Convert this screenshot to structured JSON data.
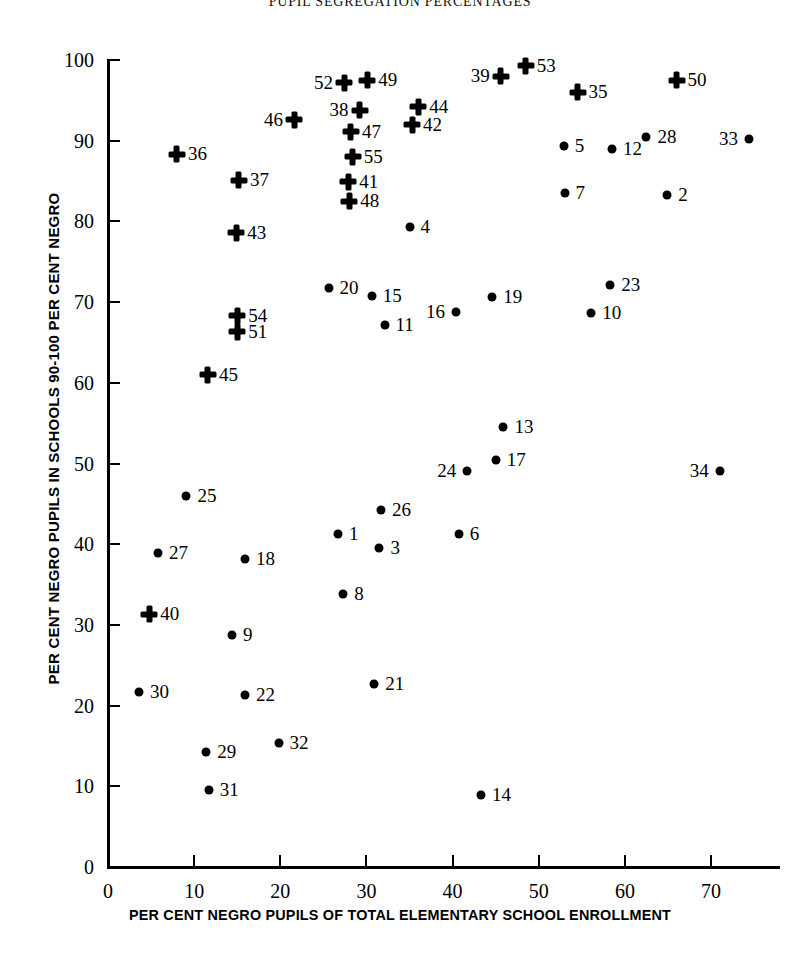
{
  "title": "PUPIL SEGREGATION PERCENTAGES",
  "axes": {
    "x_title": "PER CENT NEGRO PUPILS OF TOTAL ELEMENTARY SCHOOL ENROLLMENT",
    "y_title": "PER CENT NEGRO PUPILS IN SCHOOLS 90-100 PER CENT NEGRO",
    "x_ticks": [
      "0",
      "10",
      "20",
      "30",
      "40",
      "50",
      "60",
      "70"
    ],
    "y_ticks": [
      "0",
      "10",
      "20",
      "30",
      "40",
      "50",
      "60",
      "70",
      "80",
      "90",
      "100"
    ]
  },
  "chart_data": {
    "type": "scatter",
    "title": "PUPIL SEGREGATION PERCENTAGES",
    "xlabel": "PER CENT NEGRO PUPILS OF TOTAL ELEMENTARY SCHOOL ENROLLMENT",
    "ylabel": "PER CENT NEGRO PUPILS IN SCHOOLS 90-100 PER CENT NEGRO",
    "xlim": [
      0,
      78
    ],
    "ylim": [
      0,
      100
    ],
    "xticks": [
      0,
      10,
      20,
      30,
      40,
      50,
      60,
      70
    ],
    "yticks": [
      0,
      10,
      20,
      30,
      40,
      50,
      60,
      70,
      80,
      90,
      100
    ],
    "grid": false,
    "legend": "none",
    "series": [
      {
        "name": "circle-marker-cities",
        "marker": "circle",
        "points": [
          {
            "label": "1",
            "x": 26.7,
            "y": 41.3,
            "label_side": "right"
          },
          {
            "label": "2",
            "x": 64.9,
            "y": 83.3,
            "label_side": "right"
          },
          {
            "label": "3",
            "x": 31.5,
            "y": 39.5,
            "label_side": "right"
          },
          {
            "label": "4",
            "x": 35.0,
            "y": 79.3,
            "label_side": "right"
          },
          {
            "label": "5",
            "x": 52.9,
            "y": 89.3,
            "label_side": "right"
          },
          {
            "label": "6",
            "x": 40.7,
            "y": 41.3,
            "label_side": "right"
          },
          {
            "label": "7",
            "x": 53.0,
            "y": 83.5,
            "label_side": "right"
          },
          {
            "label": "8",
            "x": 27.3,
            "y": 33.8,
            "label_side": "right"
          },
          {
            "label": "9",
            "x": 14.4,
            "y": 28.7,
            "label_side": "right"
          },
          {
            "label": "10",
            "x": 56.1,
            "y": 68.6,
            "label_side": "right"
          },
          {
            "label": "11",
            "x": 32.1,
            "y": 67.2,
            "label_side": "right"
          },
          {
            "label": "12",
            "x": 58.5,
            "y": 89.0,
            "label_side": "right"
          },
          {
            "label": "13",
            "x": 45.9,
            "y": 54.5,
            "label_side": "right"
          },
          {
            "label": "14",
            "x": 43.3,
            "y": 8.9,
            "label_side": "right"
          },
          {
            "label": "15",
            "x": 30.6,
            "y": 70.8,
            "label_side": "right"
          },
          {
            "label": "16",
            "x": 40.4,
            "y": 68.8,
            "label_side": "left"
          },
          {
            "label": "17",
            "x": 45.0,
            "y": 50.4,
            "label_side": "right"
          },
          {
            "label": "18",
            "x": 15.9,
            "y": 38.2,
            "label_side": "right"
          },
          {
            "label": "19",
            "x": 44.6,
            "y": 70.6,
            "label_side": "right"
          },
          {
            "label": "20",
            "x": 25.6,
            "y": 71.7,
            "label_side": "right"
          },
          {
            "label": "21",
            "x": 30.9,
            "y": 22.7,
            "label_side": "right"
          },
          {
            "label": "22",
            "x": 15.9,
            "y": 21.3,
            "label_side": "right"
          },
          {
            "label": "23",
            "x": 58.3,
            "y": 72.1,
            "label_side": "right"
          },
          {
            "label": "24",
            "x": 41.7,
            "y": 49.1,
            "label_side": "left"
          },
          {
            "label": "25",
            "x": 9.1,
            "y": 46.0,
            "label_side": "right"
          },
          {
            "label": "26",
            "x": 31.7,
            "y": 44.2,
            "label_side": "right"
          },
          {
            "label": "27",
            "x": 5.8,
            "y": 38.9,
            "label_side": "right"
          },
          {
            "label": "28",
            "x": 62.5,
            "y": 90.4,
            "label_side": "right"
          },
          {
            "label": "29",
            "x": 11.4,
            "y": 14.3,
            "label_side": "right"
          },
          {
            "label": "30",
            "x": 3.6,
            "y": 21.7,
            "label_side": "right"
          },
          {
            "label": "31",
            "x": 11.7,
            "y": 9.6,
            "label_side": "right"
          },
          {
            "label": "32",
            "x": 19.8,
            "y": 15.4,
            "label_side": "right"
          },
          {
            "label": "33",
            "x": 74.4,
            "y": 90.2,
            "label_side": "left"
          },
          {
            "label": "34",
            "x": 71.0,
            "y": 49.1,
            "label_side": "left"
          }
        ]
      },
      {
        "name": "cross-marker-cities",
        "marker": "cross",
        "points": [
          {
            "label": "35",
            "x": 54.5,
            "y": 96.0,
            "label_side": "right"
          },
          {
            "label": "36",
            "x": 8.0,
            "y": 88.3,
            "label_side": "right"
          },
          {
            "label": "37",
            "x": 15.2,
            "y": 85.1,
            "label_side": "right"
          },
          {
            "label": "38",
            "x": 29.2,
            "y": 93.8,
            "label_side": "left"
          },
          {
            "label": "39",
            "x": 45.6,
            "y": 98.0,
            "label_side": "left"
          },
          {
            "label": "40",
            "x": 4.8,
            "y": 31.3,
            "label_side": "right"
          },
          {
            "label": "41",
            "x": 27.9,
            "y": 84.9,
            "label_side": "right"
          },
          {
            "label": "42",
            "x": 35.3,
            "y": 92.0,
            "label_side": "right"
          },
          {
            "label": "43",
            "x": 14.9,
            "y": 78.6,
            "label_side": "right"
          },
          {
            "label": "44",
            "x": 36.0,
            "y": 94.2,
            "label_side": "right"
          },
          {
            "label": "45",
            "x": 11.6,
            "y": 61.0,
            "label_side": "right"
          },
          {
            "label": "46",
            "x": 21.6,
            "y": 92.6,
            "label_side": "left"
          },
          {
            "label": "47",
            "x": 28.2,
            "y": 91.1,
            "label_side": "right"
          },
          {
            "label": "48",
            "x": 28.0,
            "y": 82.5,
            "label_side": "right"
          },
          {
            "label": "49",
            "x": 30.1,
            "y": 97.5,
            "label_side": "right"
          },
          {
            "label": "50",
            "x": 66.0,
            "y": 97.5,
            "label_side": "right"
          },
          {
            "label": "51",
            "x": 15.0,
            "y": 66.3,
            "label_side": "right"
          },
          {
            "label": "52",
            "x": 27.4,
            "y": 97.2,
            "label_side": "left"
          },
          {
            "label": "53",
            "x": 48.5,
            "y": 99.3,
            "label_side": "right"
          },
          {
            "label": "54",
            "x": 15.0,
            "y": 68.3,
            "label_side": "right"
          },
          {
            "label": "55",
            "x": 28.4,
            "y": 88.0,
            "label_side": "right"
          }
        ]
      }
    ]
  }
}
